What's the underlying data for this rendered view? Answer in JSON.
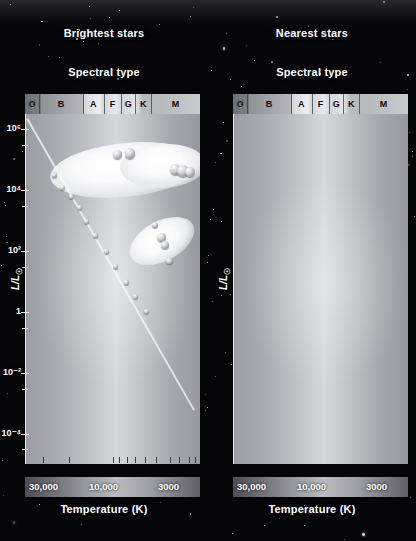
{
  "figure": {
    "x_axis_title": "Temperature (K)",
    "y_axis_title": "L/L",
    "y_axis_symbol": "☉",
    "spectral_title": "Spectral type"
  },
  "panels": [
    {
      "id": "brightest",
      "title": "Brightest stars",
      "spectral_title": "Spectral type",
      "spectral_classes": [
        "O",
        "B",
        "A",
        "F",
        "G",
        "K",
        "M"
      ],
      "y_ticks": [
        "10⁶",
        "10⁴",
        "10²",
        "1",
        "10⁻²",
        "10⁻⁴"
      ],
      "x_ticks": [
        "30,000",
        "10,000",
        "3000"
      ],
      "region_labels": [
        "Supergiants",
        "Giants",
        "Main sequence"
      ],
      "sun_label": "Sun",
      "caption": "The brightest stars in the sky tend to be highly luminous stars — upper-main-sequence stars, giants, or supergiants. They look bright because they are luminous, not because they are nearby."
    },
    {
      "id": "nearest",
      "title": "Nearest stars",
      "spectral_title": "Spectral type",
      "spectral_classes": [
        "O",
        "B",
        "A",
        "F",
        "G",
        "K",
        "M"
      ],
      "y_ticks": [
        "10⁵",
        "10⁴",
        "10²",
        "1",
        "10⁻²",
        "10⁻⁴"
      ],
      "x_ticks": [
        "30,000",
        "10,000",
        "3000"
      ],
      "region_labels": [
        "Giants",
        "Main sequence",
        "White dwarfs",
        "Red dwarfs"
      ],
      "sun_label": "Sun",
      "caption": "The nearest stars in space tend to be very faint stars — lower-main-sequence red dwarfs or white dwarfs. Nearly all of these stars are faint in the sky even though they are nearby. Only a few are visible to the unaided eye."
    }
  ],
  "chart_data": {
    "type": "scatter",
    "xlabel": "Temperature (K)",
    "ylabel": "L/L☉",
    "x_scale": "log-reversed",
    "y_scale": "log",
    "xlim": [
      40000,
      2500
    ],
    "ylim": [
      1e-05,
      3000000
    ],
    "x_tick_values": [
      30000,
      10000,
      3000
    ],
    "x_tick_labels": [
      "30,000",
      "10,000",
      "3000"
    ],
    "y_tick_values": [
      1000000,
      10000,
      100,
      1,
      0.01,
      0.0001
    ],
    "y_tick_labels": [
      "10^6",
      "10^4",
      "10^2",
      "1",
      "10^-2",
      "10^-4"
    ],
    "spectral_axis": {
      "classes": [
        "O",
        "B",
        "A",
        "F",
        "G",
        "K",
        "M"
      ],
      "boundaries_pct": [
        0,
        8,
        33,
        45,
        55,
        63,
        72,
        100
      ]
    },
    "grid": false,
    "legend": "none",
    "panels": [
      {
        "name": "Brightest stars",
        "regions": [
          {
            "label": "Supergiants",
            "y_range": [
              10000,
              1000000
            ],
            "x_range": [
              40000,
              3000
            ]
          },
          {
            "label": "Giants",
            "y_range": [
              30,
              1000
            ],
            "x_range": [
              7000,
              3000
            ]
          },
          {
            "label": "Main sequence",
            "y_range": [
              0.001,
              1000000
            ],
            "x_range": [
              40000,
              2500
            ]
          }
        ],
        "annotations": [
          {
            "label": "Sun",
            "x": 5800,
            "y": 1
          }
        ],
        "series": [
          {
            "name": "main-sequence stars",
            "points": [
              {
                "x": 25000,
                "y": 30000
              },
              {
                "x": 22000,
                "y": 12000
              },
              {
                "x": 19000,
                "y": 6000
              },
              {
                "x": 17000,
                "y": 2500
              },
              {
                "x": 15000,
                "y": 900
              },
              {
                "x": 13000,
                "y": 300
              },
              {
                "x": 11000,
                "y": 90
              },
              {
                "x": 9500,
                "y": 30
              },
              {
                "x": 8000,
                "y": 9
              },
              {
                "x": 7000,
                "y": 3
              },
              {
                "x": 5800,
                "y": 1
              }
            ]
          },
          {
            "name": "supergiants",
            "points": [
              {
                "x": 9000,
                "y": 120000
              },
              {
                "x": 8000,
                "y": 130000
              },
              {
                "x": 3600,
                "y": 60000
              },
              {
                "x": 3300,
                "y": 55000
              },
              {
                "x": 3100,
                "y": 50000
              }
            ]
          },
          {
            "name": "giants",
            "points": [
              {
                "x": 5200,
                "y": 600
              },
              {
                "x": 4600,
                "y": 250
              },
              {
                "x": 4400,
                "y": 180
              },
              {
                "x": 4000,
                "y": 70
              }
            ]
          }
        ]
      },
      {
        "name": "Nearest stars",
        "regions": [
          {
            "label": "Giants",
            "y_range": [
              30,
              1000
            ],
            "x_range": [
              6000,
              3200
            ]
          },
          {
            "label": "Main sequence",
            "y_range": [
              0.0001,
              1000
            ],
            "x_range": [
              12000,
              2500
            ]
          },
          {
            "label": "White dwarfs",
            "y_range": [
              0.0001,
              0.03
            ],
            "x_range": [
              14000,
              4000
            ]
          },
          {
            "label": "Red dwarfs",
            "y_range": [
              0.0001,
              0.05
            ],
            "x_range": [
              3800,
              2500
            ]
          }
        ],
        "annotations": [
          {
            "label": "Sun",
            "x": 5800,
            "y": 1
          }
        ],
        "series": [
          {
            "name": "main-sequence stars",
            "points": [
              {
                "x": 9000,
                "y": 400
              },
              {
                "x": 7200,
                "y": 40
              },
              {
                "x": 6800,
                "y": 20
              },
              {
                "x": 6200,
                "y": 6
              },
              {
                "x": 5800,
                "y": 1
              },
              {
                "x": 5200,
                "y": 0.5
              },
              {
                "x": 4800,
                "y": 0.2
              },
              {
                "x": 4400,
                "y": 0.08
              },
              {
                "x": 4100,
                "y": 0.03
              },
              {
                "x": 3900,
                "y": 0.012
              }
            ]
          },
          {
            "name": "giants",
            "points": [
              {
                "x": 5000,
                "y": 120
              },
              {
                "x": 4700,
                "y": 90
              },
              {
                "x": 4500,
                "y": 60
              },
              {
                "x": 4200,
                "y": 25
              }
            ]
          },
          {
            "name": "white dwarfs",
            "count": 34,
            "y_range": [
              0.0001,
              0.02
            ],
            "x_range": [
              13000,
              4500
            ]
          },
          {
            "name": "red dwarfs",
            "count": 46,
            "y_range": [
              8e-05,
              0.05
            ],
            "x_range": [
              3700,
              2550
            ]
          }
        ]
      }
    ]
  }
}
